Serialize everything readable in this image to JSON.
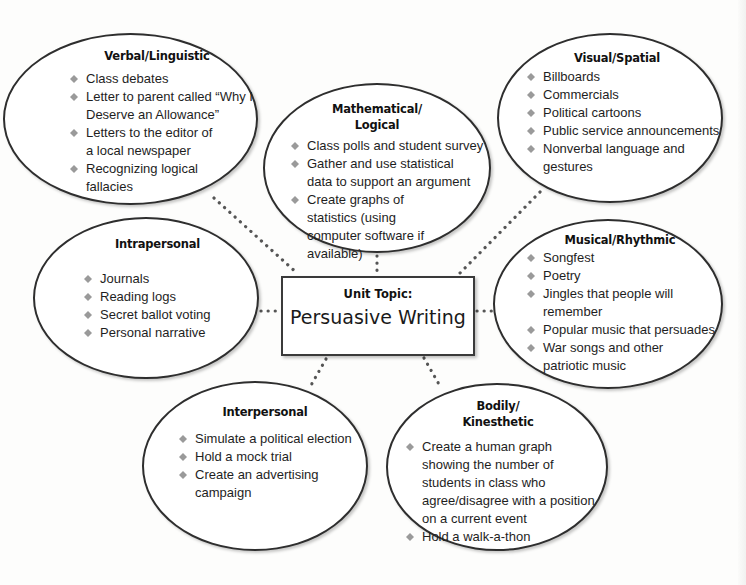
{
  "diagram": {
    "center": {
      "label": "Unit Topic:",
      "title": "Persuasive Writing"
    },
    "bullet_icon": "diamond-bullet",
    "bullet_color": "#9a9a9a",
    "line_color": "#2e2e2e",
    "connector_color": "#555555",
    "nodes": [
      {
        "id": "verbal",
        "title": "Verbal/Linguistic",
        "items": [
          "Class debates",
          "Letter to parent called “Why I Deserve an Allowance”",
          "Letters to the editor of a local newspaper",
          "Recognizing logical fallacies"
        ]
      },
      {
        "id": "math",
        "title": "Mathematical/ Logical",
        "items": [
          "Class polls and student survey",
          "Gather and use statistical data to support an argument",
          "Create graphs of statistics (using computer software if available)"
        ]
      },
      {
        "id": "visual",
        "title": "Visual/Spatial",
        "items": [
          "Billboards",
          "Commercials",
          "Political cartoons",
          "Public service announcements",
          "Nonverbal language and gestures"
        ]
      },
      {
        "id": "intrapersonal",
        "title": "Intrapersonal",
        "items": [
          "Journals",
          "Reading logs",
          "Secret ballot voting",
          "Personal narrative"
        ]
      },
      {
        "id": "musical",
        "title": "Musical/Rhythmic",
        "items": [
          "Songfest",
          "Poetry",
          "Jingles that people will remember",
          "Popular music that persuades",
          "War songs and other patriotic music"
        ]
      },
      {
        "id": "interpersonal",
        "title": "Interpersonal",
        "items": [
          "Simulate a political election",
          "Hold a mock trial",
          "Create an advertising campaign"
        ]
      },
      {
        "id": "bodily",
        "title": "Bodily/ Kinesthetic",
        "items": [
          "Create a human graph showing the number of students in class who agree/disagree with a position on a current event",
          "Hold a walk-a-thon"
        ]
      }
    ]
  }
}
